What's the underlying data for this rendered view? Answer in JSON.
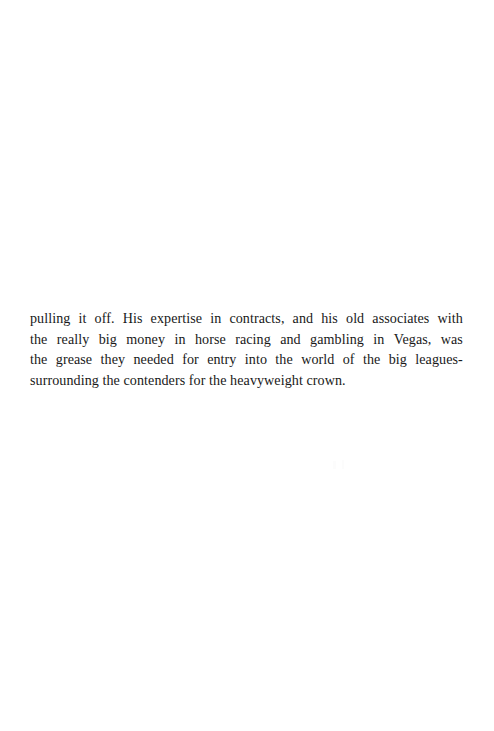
{
  "page": {
    "kind": "scanned-book-page",
    "width": 494,
    "height": 731,
    "background_color": "#ffffff",
    "text_color": "#191919",
    "page_number": "",
    "header": "",
    "footer": ""
  },
  "content": {
    "paragraph_full_text": "pulling it off. His expertise in contracts, and his old associates with the really big money in horse racing and gambling in Vegas, was the grease they needed for entry into the world of the big leagues-surrounding the contenders for the heavyweight crown.",
    "lines": [
      "pulling it off. His expertise in contracts, and his old associates with",
      "the really big money in horse racing and gambling in Vegas, was",
      "the grease they needed for entry into the world of the big leagues-",
      "surrounding the contenders for the heavyweight crown."
    ],
    "line_words": [
      [
        "pulling",
        "it",
        "off.",
        "His",
        "expertise",
        "in",
        "contracts,",
        "and",
        "his",
        "old",
        "associates",
        "with"
      ],
      [
        "the",
        "really",
        "big",
        "money",
        "in",
        "horse",
        "racing",
        "and",
        "gambling",
        "in",
        "Vegas,",
        "was"
      ],
      [
        "the",
        "grease",
        "they",
        "needed",
        "for",
        "entry",
        "into",
        "the",
        "world",
        "of",
        "the",
        "big",
        "leagues-"
      ],
      [
        "surrounding the contenders for the heavyweight crown."
      ]
    ]
  }
}
